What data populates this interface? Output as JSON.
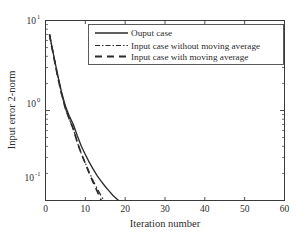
{
  "chart_data": {
    "type": "line",
    "title": "",
    "xlabel": "Iteration number",
    "ylabel": "Input error 2-norm",
    "xlim": [
      0,
      60
    ],
    "ylim": [
      0.1,
      10
    ],
    "yscale": "log",
    "xscale": "linear",
    "grid": false,
    "legend_position": "top-right",
    "xticks": [
      "0",
      "10",
      "20",
      "30",
      "40",
      "50",
      "60"
    ],
    "xtick_values": [
      0,
      10,
      20,
      30,
      40,
      50,
      60
    ],
    "yticks": [
      "10^-1",
      "10^0",
      "10^1"
    ],
    "ytick_values": [
      0.1,
      1,
      10
    ],
    "ytick_base": "10",
    "ytick_exponents": [
      "-1",
      "0",
      "1"
    ],
    "x": [
      1,
      2,
      3,
      4,
      5,
      6,
      7,
      8,
      9,
      10,
      11,
      12,
      13,
      14,
      15,
      16,
      17,
      18,
      19,
      20,
      21,
      22,
      23,
      24,
      25,
      26,
      27,
      28,
      29,
      30,
      31,
      32,
      33,
      34,
      35,
      36,
      37,
      38,
      39,
      40,
      41,
      42,
      43,
      44,
      45,
      46,
      47,
      48,
      49,
      50,
      51,
      52,
      53,
      54,
      55,
      56,
      57,
      58,
      59,
      60
    ],
    "series": [
      {
        "name": "Ouput case",
        "style": "solid",
        "color": "#2b2b2b",
        "values": [
          7.0,
          4.2,
          2.55,
          1.62,
          1.12,
          0.86,
          0.7,
          0.52,
          0.4,
          0.325,
          0.265,
          0.222,
          0.188,
          0.163,
          0.143,
          0.127,
          0.113,
          0.103,
          0.095,
          0.086,
          0.078,
          0.072,
          0.068,
          0.066,
          0.068,
          0.07,
          0.069,
          0.071,
          0.073,
          0.072,
          0.074,
          0.073,
          0.075,
          0.074,
          0.076,
          0.075,
          0.074,
          0.075,
          0.073,
          0.075,
          0.077,
          0.078,
          0.079,
          0.08,
          0.082,
          0.083,
          0.084,
          0.085,
          0.086,
          0.09,
          0.088,
          0.089,
          0.091,
          0.09,
          0.089,
          0.09,
          0.089,
          0.09,
          0.091,
          0.092
        ]
      },
      {
        "name": "Input case without moving average",
        "style": "dashdot",
        "color": "#2b2b2b",
        "values": [
          7.0,
          4.1,
          2.45,
          1.55,
          1.05,
          0.8,
          0.62,
          0.44,
          0.33,
          0.26,
          0.205,
          0.165,
          0.135,
          0.112,
          0.095,
          0.082,
          0.073,
          0.068,
          0.065,
          0.063,
          0.062,
          0.063,
          0.065,
          0.07,
          0.074,
          0.072,
          0.07,
          0.072,
          0.076,
          0.078,
          0.075,
          0.071,
          0.073,
          0.077,
          0.079,
          0.077,
          0.073,
          0.071,
          0.073,
          0.076,
          0.074,
          0.072,
          0.073,
          0.075,
          0.076,
          0.077,
          0.078,
          0.079,
          0.08,
          0.081,
          0.08,
          0.079,
          0.08,
          0.081,
          0.08,
          0.079,
          0.078,
          0.078,
          0.077,
          0.077
        ]
      },
      {
        "name": "Input case with moving average",
        "style": "dashed",
        "color": "#2b2b2b",
        "values": [
          7.0,
          4.1,
          2.45,
          1.55,
          1.05,
          0.8,
          0.62,
          0.44,
          0.33,
          0.258,
          0.2,
          0.158,
          0.126,
          0.1,
          0.08,
          0.063,
          0.058,
          0.056,
          0.055,
          0.054,
          0.054,
          0.053,
          0.053,
          0.053,
          0.052,
          0.052,
          0.052,
          0.052,
          0.052,
          0.052,
          0.052,
          0.052,
          0.052,
          0.052,
          0.052,
          0.052,
          0.052,
          0.052,
          0.053,
          0.053,
          0.053,
          0.053,
          0.053,
          0.053,
          0.053,
          0.054,
          0.054,
          0.054,
          0.054,
          0.054,
          0.054,
          0.054,
          0.055,
          0.055,
          0.055,
          0.055,
          0.055,
          0.056,
          0.056,
          0.056
        ]
      }
    ]
  },
  "legend": {
    "entries": [
      {
        "label": "Ouput case",
        "style": "solid"
      },
      {
        "label": "Input case without moving average",
        "style": "dashdot"
      },
      {
        "label": "Input case with moving average",
        "style": "dashed"
      }
    ]
  },
  "axes": {
    "xlabel": "Iteration number",
    "ylabel": "Input error 2-norm",
    "xticks": [
      "0",
      "10",
      "20",
      "30",
      "40",
      "50",
      "60"
    ],
    "ytick_base": "10",
    "ytick_exp_top": "1",
    "ytick_exp_mid": "0",
    "ytick_exp_bot": "-1"
  },
  "colors": {
    "line": "#2b2b2b",
    "axis": "#3a3a3a",
    "background": "#ffffff"
  }
}
